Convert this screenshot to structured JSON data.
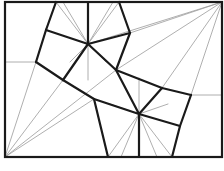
{
  "diagram": {
    "type": "geometric-tiling",
    "colors": {
      "background": "#ffffff",
      "thick_line": "#1a1a1a",
      "thin_line": "#9a9a9a"
    },
    "frame": {
      "x1": 5,
      "y1": 2,
      "x2": 222,
      "y2": 157
    },
    "centers": [
      {
        "name": "upper-center",
        "x": 88,
        "y": 44
      },
      {
        "name": "lower-center",
        "x": 139,
        "y": 114
      }
    ],
    "thick_segments": [
      [
        56,
        2,
        46,
        30
      ],
      [
        46,
        30,
        36,
        62
      ],
      [
        119,
        2,
        130,
        33
      ],
      [
        130,
        33,
        116,
        70
      ],
      [
        88,
        2,
        88,
        44
      ],
      [
        46,
        30,
        88,
        44
      ],
      [
        130,
        33,
        88,
        44
      ],
      [
        88,
        44,
        63,
        80
      ],
      [
        88,
        44,
        116,
        70
      ],
      [
        36,
        62,
        63,
        80
      ],
      [
        63,
        80,
        94,
        99
      ],
      [
        116,
        70,
        162,
        88
      ],
      [
        116,
        70,
        139,
        114
      ],
      [
        94,
        99,
        139,
        114
      ],
      [
        162,
        88,
        191,
        95
      ],
      [
        162,
        88,
        139,
        114
      ],
      [
        139,
        114,
        180,
        126
      ],
      [
        191,
        95,
        180,
        126
      ],
      [
        180,
        126,
        172,
        157
      ],
      [
        94,
        99,
        108,
        157
      ],
      [
        139,
        114,
        139,
        157
      ]
    ],
    "thin_segments": [
      [
        5,
        157,
        36,
        62
      ],
      [
        5,
        157,
        63,
        80
      ],
      [
        5,
        157,
        94,
        99
      ],
      [
        5,
        157,
        116,
        70
      ],
      [
        5,
        157,
        108,
        157
      ],
      [
        222,
        2,
        130,
        33
      ],
      [
        222,
        2,
        162,
        88
      ],
      [
        222,
        2,
        191,
        95
      ],
      [
        222,
        2,
        116,
        70
      ],
      [
        222,
        2,
        88,
        44
      ],
      [
        5,
        62,
        36,
        62
      ],
      [
        191,
        95,
        222,
        95
      ],
      [
        88,
        44,
        88,
        2
      ],
      [
        88,
        44,
        63,
        2
      ],
      [
        88,
        44,
        113,
        2
      ],
      [
        88,
        44,
        56,
        2
      ],
      [
        88,
        44,
        119,
        2
      ],
      [
        88,
        44,
        88,
        80
      ],
      [
        88,
        44,
        70,
        62
      ],
      [
        88,
        44,
        106,
        62
      ],
      [
        139,
        114,
        139,
        78
      ],
      [
        139,
        114,
        121,
        157
      ],
      [
        139,
        114,
        157,
        157
      ],
      [
        139,
        114,
        108,
        157
      ],
      [
        139,
        114,
        172,
        157
      ],
      [
        139,
        114,
        110,
        104
      ],
      [
        139,
        114,
        168,
        104
      ]
    ]
  }
}
